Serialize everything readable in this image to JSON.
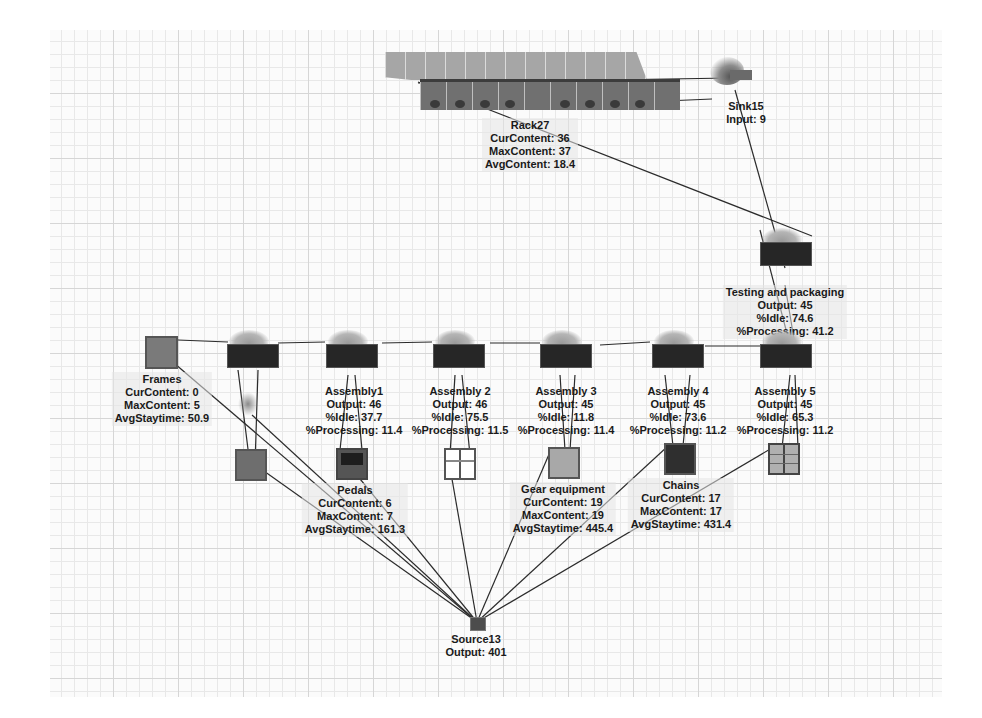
{
  "canvas": {
    "background": "#fbfbfb",
    "grid_color": "#d6d6d6",
    "link_color": "#2b2b2b"
  },
  "nodes": {
    "rack": {
      "name": "Rack27",
      "stats": [
        "CurContent:  36",
        "MaxContent: 37",
        "AvgContent:  18.4"
      ]
    },
    "sink": {
      "name": "Sink15",
      "stats": [
        "Input: 9"
      ]
    },
    "testing": {
      "name": "Testing and packaging",
      "stats": [
        "Output: 45",
        "%Idle:  74.6",
        "%Processing: 41.2"
      ]
    },
    "frames": {
      "name": "Frames",
      "stats": [
        "CurContent:  0",
        "MaxContent:  5",
        "AvgStaytime: 50.9"
      ]
    },
    "assembly1": {
      "name": "Assembly1",
      "stats": [
        "Output: 46",
        "%Idle:  37.7",
        "%Processing: 11.4"
      ]
    },
    "assembly2": {
      "name": "Assembly 2",
      "stats": [
        "Output: 46",
        "%Idle:  75.5",
        "%Processing: 11.5"
      ]
    },
    "assembly3": {
      "name": "Assembly 3",
      "stats": [
        "Output: 45",
        "%Idle:  11.8",
        "%Processing: 11.4"
      ]
    },
    "assembly4": {
      "name": "Assembly 4",
      "stats": [
        "Output: 45",
        "%Idle:  73.6",
        "%Processing: 11.2"
      ]
    },
    "assembly5": {
      "name": "Assembly 5",
      "stats": [
        "Output: 45",
        "%Idle:  65.3",
        "%Processing: 11.2"
      ]
    },
    "pedals": {
      "name": "Pedals",
      "stats": [
        "CurContent:  6",
        "MaxContent:  7",
        "AvgStaytime: 161.3"
      ]
    },
    "gear": {
      "name": "Gear equipment",
      "stats": [
        "CurContent:  19",
        "MaxContent:  19",
        "AvgStaytime: 445.4"
      ]
    },
    "chains": {
      "name": "Chains",
      "stats": [
        "CurContent:  17",
        "MaxContent:  17",
        "AvgStaytime: 431.4"
      ]
    },
    "source": {
      "name": "Source13",
      "stats": [
        "Output: 401"
      ]
    }
  }
}
